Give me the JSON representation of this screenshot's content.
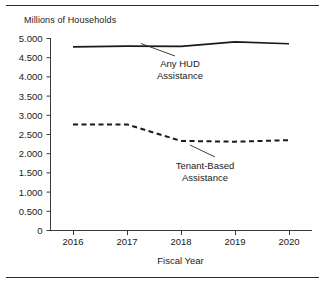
{
  "chart_data": {
    "type": "line",
    "title": "",
    "subtitle": "",
    "ylabel": "Millions of Households",
    "xlabel": "Fiscal Year",
    "x": [
      "2016",
      "2017",
      "2018",
      "2019",
      "2020"
    ],
    "categories": [
      "2016",
      "2017",
      "2018",
      "2019",
      "2020"
    ],
    "ylim": [
      0,
      5.0
    ],
    "ytick_labels": [
      "0",
      "0.500",
      "1.000",
      "1.500",
      "2.000",
      "2.500",
      "3.000",
      "3.500",
      "4.000",
      "4.500",
      "5.000"
    ],
    "ytick_values": [
      0,
      0.5,
      1.0,
      1.5,
      2.0,
      2.5,
      3.0,
      3.5,
      4.0,
      4.5,
      5.0
    ],
    "xtick_labels": [
      "2016",
      "2017",
      "2018",
      "2019",
      "2020"
    ],
    "grid": false,
    "legend_position": "inline-annotation",
    "series": [
      {
        "name": "Any HUD Assistance",
        "style": "solid",
        "color": "#1a1a1a",
        "values": [
          4.77,
          4.79,
          4.78,
          4.9,
          4.85
        ]
      },
      {
        "name": "Tenant-Based Assistance",
        "style": "dashed",
        "color": "#1a1a1a",
        "values": [
          2.75,
          2.75,
          2.32,
          2.3,
          2.34
        ]
      }
    ],
    "annotations": [
      {
        "name": "any-hud-assistance",
        "line1": "Any HUD",
        "line2": "Assistance"
      },
      {
        "name": "tenant-based-assistance",
        "line1": "Tenant-Based",
        "line2": "Assistance"
      }
    ]
  },
  "axes": {
    "y_title": "Millions of Households",
    "x_title": "Fiscal Year"
  },
  "annotations": {
    "hud": {
      "line1": "Any HUD",
      "line2": "Assistance"
    },
    "tenant": {
      "line1": "Tenant-Based",
      "line2": "Assistance"
    }
  }
}
